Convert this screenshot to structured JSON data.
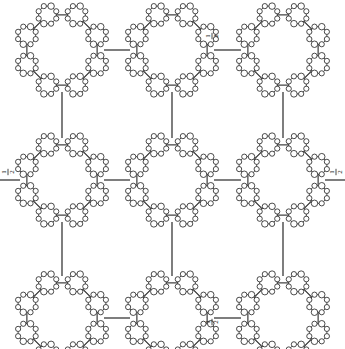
{
  "figure": {
    "type": "diagram",
    "background_color": "#ffffff",
    "ink_color": "#1f1f1f",
    "node_fill_color": "#ffffff",
    "canvas": {
      "width": 345,
      "height": 349
    }
  },
  "chart_data": {
    "type": "diagram",
    "title": "",
    "grid": {
      "rows": 3,
      "cols": 3
    },
    "cluster_centers": [
      {
        "id": "c00",
        "row": 0,
        "col": 0,
        "x": 62,
        "y": 50
      },
      {
        "id": "c01",
        "row": 0,
        "col": 1,
        "x": 172,
        "y": 50
      },
      {
        "id": "c02",
        "row": 0,
        "col": 2,
        "x": 283,
        "y": 50
      },
      {
        "id": "c10",
        "row": 1,
        "col": 0,
        "x": 62,
        "y": 180
      },
      {
        "id": "c11",
        "row": 1,
        "col": 1,
        "x": 172,
        "y": 180
      },
      {
        "id": "c12",
        "row": 1,
        "col": 2,
        "x": 283,
        "y": 180
      },
      {
        "id": "c20",
        "row": 2,
        "col": 0,
        "x": 62,
        "y": 318
      },
      {
        "id": "c21",
        "row": 2,
        "col": 1,
        "x": 172,
        "y": 318
      },
      {
        "id": "c22",
        "row": 2,
        "col": 2,
        "x": 283,
        "y": 318
      }
    ],
    "cluster_radius": 38,
    "macro_node_count": 8,
    "micro_node_count_per_macro": 8,
    "micro_ring_radius": 9.5,
    "micro_dot_radius": 2.6,
    "edge_labels": [
      {
        "text_numerator": "1",
        "text_denominator": "2",
        "x": 212,
        "y": 36,
        "orientation": "vertical",
        "attached_to": "c01-c02"
      },
      {
        "text_numerator": "1",
        "text_denominator": "2",
        "x": 8,
        "y": 172,
        "orientation": "vertical",
        "attached_to": "c10-left"
      },
      {
        "text_numerator": "1",
        "text_denominator": "2",
        "x": 336,
        "y": 172,
        "orientation": "vertical",
        "attached_to": "c12-right"
      },
      {
        "text_numerator": "1",
        "text_denominator": "2",
        "x": 212,
        "y": 322,
        "orientation": "vertical",
        "attached_to": "c21-c22"
      }
    ],
    "connector_edges": [
      {
        "from": "c00",
        "to": "c01",
        "direction": "horizontal"
      },
      {
        "from": "c01",
        "to": "c02",
        "direction": "horizontal"
      },
      {
        "from": "c10",
        "to": "c11",
        "direction": "horizontal"
      },
      {
        "from": "c11",
        "to": "c12",
        "direction": "horizontal"
      },
      {
        "from": "c20",
        "to": "c21",
        "direction": "horizontal"
      },
      {
        "from": "c21",
        "to": "c22",
        "direction": "horizontal"
      },
      {
        "from": "c00",
        "to": "c10",
        "direction": "vertical"
      },
      {
        "from": "c01",
        "to": "c11",
        "direction": "vertical"
      },
      {
        "from": "c02",
        "to": "c12",
        "direction": "vertical"
      },
      {
        "from": "c10",
        "to": "c20",
        "direction": "vertical"
      },
      {
        "from": "c11",
        "to": "c21",
        "direction": "vertical"
      },
      {
        "from": "c12",
        "to": "c22",
        "direction": "vertical"
      }
    ],
    "stub_edges": [
      {
        "at": "c10",
        "side": "left"
      },
      {
        "at": "c12",
        "side": "right"
      },
      {
        "at": "c20",
        "side": "bottom"
      },
      {
        "at": "c21",
        "side": "bottom"
      },
      {
        "at": "c22",
        "side": "bottom"
      }
    ]
  }
}
